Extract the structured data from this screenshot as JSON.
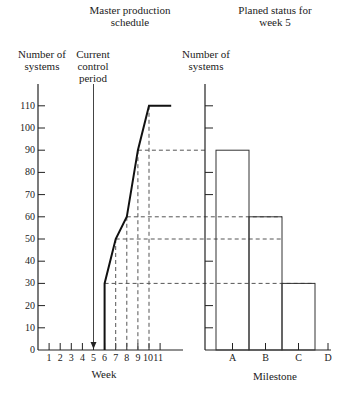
{
  "titles": {
    "left": "Master production\nschedule",
    "right": "Planed status for\nweek 5"
  },
  "labels": {
    "left_ylabel": "Number of\nsystems",
    "current_period": "Current\ncontrol\nperiod",
    "right_ylabel": "Number of\nsystems",
    "left_xlabel": "Week",
    "right_xlabel": "Milestone"
  },
  "chart_data": [
    {
      "type": "line",
      "title": "Master production schedule",
      "xlabel": "Week",
      "ylabel": "Number of systems",
      "x_ticks": [
        "1",
        "2",
        "3",
        "4",
        "5",
        "6",
        "7",
        "8",
        "9",
        "10",
        "11"
      ],
      "y_ticks": [
        0,
        10,
        20,
        30,
        40,
        50,
        60,
        70,
        80,
        90,
        100,
        110
      ],
      "ylim": [
        0,
        110
      ],
      "series": [
        {
          "name": "Cumulative schedule",
          "x": [
            6,
            6,
            7,
            8,
            9,
            10,
            12
          ],
          "y": [
            0,
            30,
            50,
            60,
            90,
            110,
            110
          ]
        }
      ],
      "annotations": [
        {
          "text": "Current control period",
          "x": 5,
          "type": "arrow-down"
        }
      ],
      "dashed_guides": [
        {
          "week": 6,
          "value": 30
        },
        {
          "week": 7,
          "value": 50
        },
        {
          "week": 8,
          "value": 60
        },
        {
          "week": 9,
          "value": 90
        },
        {
          "week": 10,
          "value": 110
        }
      ]
    },
    {
      "type": "bar",
      "title": "Planed status for week 5",
      "xlabel": "Milestone",
      "ylabel": "Number of systems",
      "categories": [
        "A",
        "B",
        "C",
        "D"
      ],
      "values": [
        90,
        60,
        30,
        0
      ],
      "ylim": [
        0,
        110
      ]
    }
  ]
}
